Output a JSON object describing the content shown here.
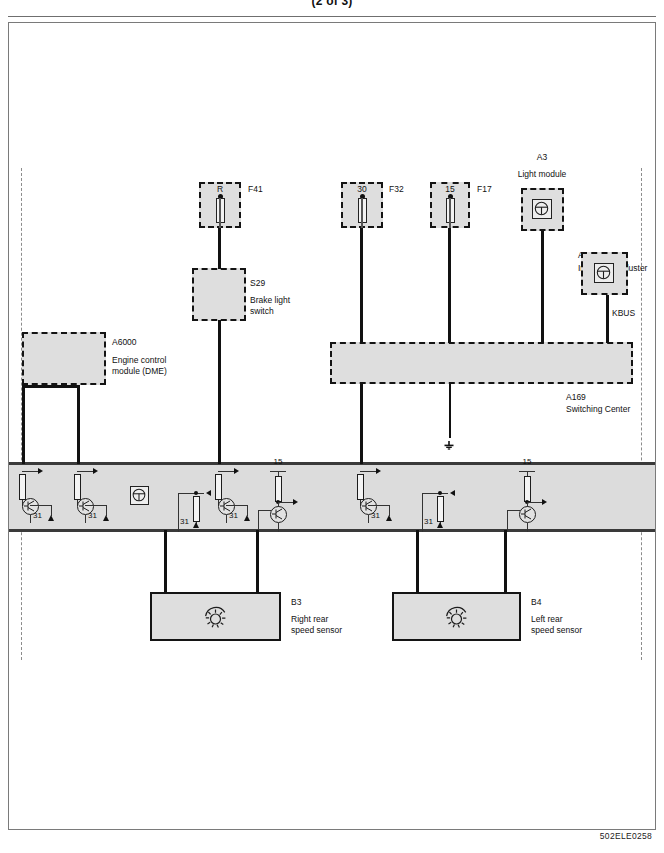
{
  "page": {
    "title": "(2 of 3)",
    "doc_code": "502ELE0258"
  },
  "fuses": [
    {
      "id": "f41",
      "terminal": "R",
      "designation": "F41"
    },
    {
      "id": "f32",
      "terminal": "30",
      "designation": "F32"
    },
    {
      "id": "f17",
      "terminal": "15",
      "designation": "F17"
    }
  ],
  "components": [
    {
      "id": "s29",
      "designation": "S29",
      "name": "Brake light\nswitch"
    },
    {
      "id": "a6000",
      "designation": "A6000",
      "name": "Engine control\nmodule (DME)"
    },
    {
      "id": "a3",
      "designation": "A3",
      "name": "Light module"
    },
    {
      "id": "a2",
      "designation": "A2",
      "name": "Instrument Cluster"
    },
    {
      "id": "a169",
      "designation": "A169",
      "name": "Switching Center"
    },
    {
      "id": "b3",
      "designation": "B3",
      "name": "Right rear\nspeed sensor"
    },
    {
      "id": "b4",
      "designation": "B4",
      "name": "Left rear\nspeed sensor"
    }
  ],
  "bus": {
    "kbus_label": "KBUS"
  },
  "ground_labels": {
    "g1": "31",
    "g2": "31",
    "g3": "31",
    "g4": "31",
    "g5": "31",
    "g6": "31"
  },
  "terminal_labels": {
    "t15_left": "15",
    "t15_right": "15"
  },
  "icons": {
    "module_chip": "module-chip-icon",
    "gear": "gear-icon",
    "fuse": "fuse-icon",
    "ground": "ground-icon",
    "earth": "earth-icon"
  },
  "colors": {
    "wire": "#111111",
    "box_fill": "#dedede",
    "band_fill": "#dcdcdc",
    "band_rule": "#3a3a3a",
    "zone_edge": "#8c8c8c"
  }
}
